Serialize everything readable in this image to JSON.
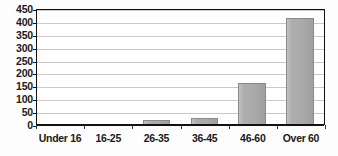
{
  "chart_data": {
    "type": "bar",
    "title": "",
    "subtitle": "",
    "xlabel": "",
    "ylabel": "",
    "categories": [
      "Under 16",
      "16-25",
      "26-35",
      "36-45",
      "46-60",
      "Over 60"
    ],
    "values": [
      0,
      0,
      16,
      22,
      160,
      412
    ],
    "ylim": [
      0,
      450
    ],
    "yticks": [
      0,
      50,
      100,
      150,
      200,
      250,
      300,
      350,
      400,
      450
    ],
    "ytick_labels": [
      "0",
      "50",
      "100",
      "150",
      "200",
      "250",
      "300",
      "350",
      "400",
      "450"
    ],
    "grid": true,
    "grid_axis": "y",
    "legend": false,
    "legend_position": "none",
    "annotations": []
  },
  "style": {
    "bar_fill": "#aaaaaa",
    "bar_border": "#8a8a8a",
    "gridline_color": "#c9c9c9",
    "axis_color": "#111111",
    "text_color": "#1a1a1a",
    "plot_background": "#ffffff",
    "page_background": "#fdfdfd"
  }
}
